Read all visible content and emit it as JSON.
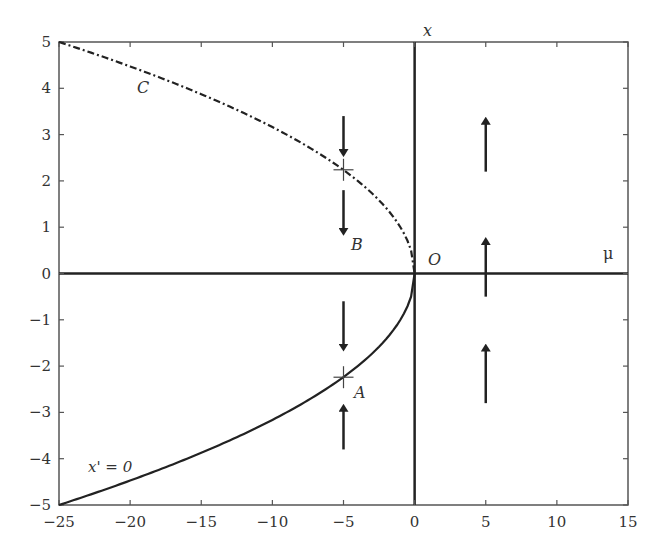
{
  "chart_data": {
    "type": "line",
    "title": "",
    "xlabel": "μ",
    "ylabel": "x",
    "xlim": [
      -25,
      15
    ],
    "ylim": [
      -5,
      5
    ],
    "x_ticks": [
      -25,
      -20,
      -15,
      -10,
      -5,
      0,
      5,
      10,
      15
    ],
    "y_ticks": [
      -5,
      -4,
      -3,
      -2,
      -1,
      0,
      1,
      2,
      3,
      4,
      5
    ],
    "x_tick_labels": [
      "−25",
      "−20",
      "−15",
      "−10",
      "−5",
      "0",
      "5",
      "10",
      "15"
    ],
    "y_tick_labels": [
      "−5",
      "−4",
      "−3",
      "−2",
      "−1",
      "0",
      "1",
      "2",
      "3",
      "4",
      "5"
    ],
    "grid": false,
    "series": [
      {
        "name": "C (upper branch, unstable, dash-dot)",
        "style": "dashdot",
        "x": [
          -25,
          -20,
          -15,
          -10,
          -5,
          -2,
          -1,
          0
        ],
        "y": [
          5,
          4.47,
          3.87,
          3.16,
          2.24,
          1.41,
          1.0,
          0
        ]
      },
      {
        "name": "x' = 0 (lower branch, stable, solid)",
        "style": "solid",
        "x": [
          -25,
          -20,
          -15,
          -10,
          -5,
          -2,
          -1,
          0
        ],
        "y": [
          -5,
          -4.47,
          -3.87,
          -3.16,
          -2.24,
          -1.41,
          -1.0,
          0
        ]
      }
    ],
    "points": [
      {
        "label": "A",
        "x": -5,
        "y": -2.24
      },
      {
        "label": "B",
        "x": -5,
        "y": 2.24
      },
      {
        "label": "O",
        "x": 0,
        "y": 0
      }
    ],
    "arrows": [
      {
        "x": -5,
        "from": 3.4,
        "to": 2.6,
        "direction": "down"
      },
      {
        "x": -5,
        "from": 1.8,
        "to": 0.9,
        "direction": "down"
      },
      {
        "x": -5,
        "from": -0.6,
        "to": -1.6,
        "direction": "down"
      },
      {
        "x": -5,
        "from": -3.8,
        "to": -2.9,
        "direction": "up"
      },
      {
        "x": 5,
        "from": 2.2,
        "to": 3.3,
        "direction": "up"
      },
      {
        "x": 5,
        "from": -0.5,
        "to": 0.7,
        "direction": "up"
      },
      {
        "x": 5,
        "from": -2.8,
        "to": -1.6,
        "direction": "up"
      }
    ],
    "annotations": [
      "C",
      "B",
      "A",
      "O",
      "x' = 0",
      "x",
      "μ"
    ]
  },
  "labels": {
    "curve_c": "C",
    "point_b": "B",
    "point_a": "A",
    "origin": "O",
    "nullcline": "x' = 0",
    "x_axis_var": "μ",
    "y_axis_var": "x"
  }
}
